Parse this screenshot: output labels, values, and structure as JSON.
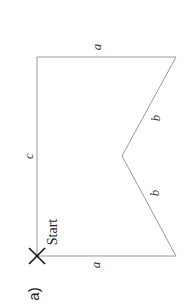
{
  "figure": {
    "panel_label": "a)",
    "start_label": "Start",
    "start_marker": "x-cross-icon",
    "edges": {
      "top_left_segment": "a",
      "left_segment": "c",
      "notch_upper_segment": "b",
      "notch_lower_segment": "b",
      "bottom_segment": "a"
    },
    "colors": {
      "line": "#9a9a9a",
      "marker": "#111111",
      "text": "#333333"
    }
  }
}
